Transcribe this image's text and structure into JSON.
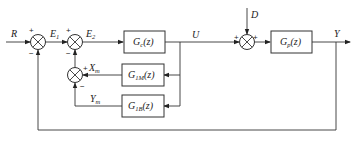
{
  "diagram": {
    "type": "block-diagram",
    "title": "",
    "signals": {
      "input": "R",
      "error1": "E",
      "error1_sub": "1",
      "error2": "E",
      "error2_sub": "2",
      "control": "U",
      "disturbance": "D",
      "output": "Y",
      "model_output_x": "X",
      "model_output_x_sub": "m",
      "model_output_y": "Y",
      "model_output_y_sub": "m"
    },
    "blocks": {
      "controller": {
        "name": "G",
        "sub": "c",
        "arg": "(z)"
      },
      "plant": {
        "name": "G",
        "sub": "p",
        "arg": "(z)"
      },
      "model_1": {
        "name": "G",
        "sub": "1M",
        "arg": "(z)"
      },
      "model_2": {
        "name": "G",
        "sub": "1B",
        "arg": "(z)"
      }
    },
    "signs": {
      "sum1_top": "+",
      "sum1_bottom": "−",
      "sum2_top": "+",
      "sum2_bottom": "−",
      "sum3_left": "+",
      "sum3_right": "+",
      "sum4_right": "+",
      "sum4_bottom": "−"
    }
  }
}
